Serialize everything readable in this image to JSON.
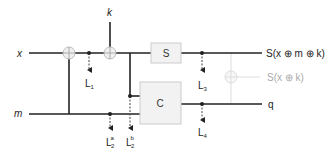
{
  "diagram": {
    "inputs": {
      "x": "x",
      "k": "k",
      "m": "m"
    },
    "blocks": {
      "s_box": "S",
      "c_box": "C"
    },
    "outputs": {
      "main": "S(x ⊕ m ⊕ k)",
      "q": "q",
      "ghost": "S(x ⊕ k)"
    },
    "leakage_points": [
      {
        "id": "L1",
        "base": "L",
        "sub": "1",
        "sup": ""
      },
      {
        "id": "L2a",
        "base": "L",
        "sub": "2",
        "sup": "a"
      },
      {
        "id": "L2b",
        "base": "L",
        "sub": "2",
        "sup": "b"
      },
      {
        "id": "L3",
        "base": "L",
        "sub": "3",
        "sup": ""
      },
      {
        "id": "L4",
        "base": "L",
        "sub": "4",
        "sup": ""
      }
    ],
    "colors": {
      "wire": "#222222",
      "xor_fill": "#f0f0f0",
      "xor_stroke": "#bbbbbb",
      "box_fill": "#f2f2f2",
      "box_stroke": "#cccccc",
      "ghost": "#cccccc"
    }
  }
}
